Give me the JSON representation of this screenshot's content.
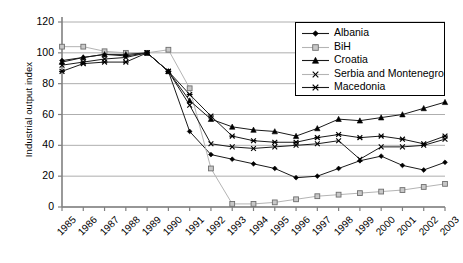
{
  "chart_data": {
    "type": "line",
    "title": "",
    "xlabel": "",
    "ylabel": "Industrial output index",
    "ylim": [
      0,
      120
    ],
    "ytick_values": [
      0,
      20,
      40,
      60,
      80,
      100,
      120
    ],
    "grid": true,
    "legend_position": "top-right",
    "categories": [
      "1985",
      "1986",
      "1987",
      "1988",
      "1989",
      "1990",
      "1991",
      "1992",
      "1993",
      "1994",
      "1995",
      "1996",
      "1997",
      "1998",
      "1999",
      "2000",
      "2001",
      "2002",
      "2003"
    ],
    "series": [
      {
        "name": "Albania",
        "marker": "diamond",
        "values": [
          95,
          97,
          99,
          98,
          100,
          88,
          49,
          34,
          31,
          28,
          25,
          19,
          20,
          25,
          30,
          33,
          27,
          24,
          29
        ]
      },
      {
        "name": "BiH",
        "marker": "square",
        "values": [
          104,
          104,
          101,
          100,
          100,
          102,
          77,
          25,
          2,
          2,
          3,
          5,
          7,
          8,
          9,
          10,
          11,
          13,
          15
        ]
      },
      {
        "name": "Croatia",
        "marker": "triangle",
        "values": [
          94,
          97,
          99,
          99,
          100,
          88,
          69,
          57,
          52,
          50,
          49,
          46,
          51,
          57,
          56,
          58,
          60,
          64,
          68
        ]
      },
      {
        "name": "Serbia and Montenegro",
        "marker": "cross",
        "values": [
          92,
          94,
          96,
          97,
          100,
          88,
          66,
          41,
          39,
          38,
          39,
          40,
          41,
          43,
          31,
          39,
          39,
          40,
          44
        ]
      },
      {
        "name": "Macedonia",
        "marker": "asterisk",
        "values": [
          88,
          93,
          94,
          94,
          100,
          88,
          73,
          59,
          46,
          43,
          42,
          42,
          45,
          47,
          45,
          46,
          44,
          41,
          46
        ]
      }
    ]
  },
  "axis": {
    "ytick_labels": [
      "0",
      "20",
      "40",
      "60",
      "80",
      "100",
      "120"
    ]
  }
}
